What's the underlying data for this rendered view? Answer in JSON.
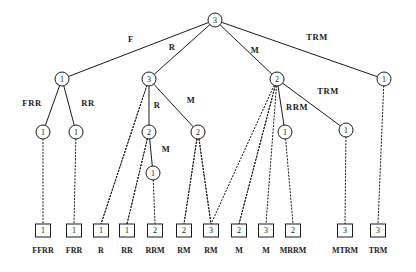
{
  "figure": {
    "type": "tree-diagram",
    "background_color": "#ffffff",
    "stroke_color": "#1a1a1a",
    "width": 416,
    "height": 272
  },
  "nodes": [
    {
      "id": "root",
      "label": "3",
      "x": 215,
      "y": 20,
      "r": 7,
      "depth": 0
    },
    {
      "id": "n-l1",
      "label": "1",
      "x": 62,
      "y": 79,
      "r": 7,
      "depth": 1
    },
    {
      "id": "n-l2",
      "label": "3",
      "x": 149,
      "y": 79,
      "r": 7,
      "depth": 1
    },
    {
      "id": "n-l3",
      "label": "2",
      "x": 277,
      "y": 79,
      "r": 7,
      "depth": 1
    },
    {
      "id": "n-l4",
      "label": "1",
      "x": 384,
      "y": 79,
      "r": 7,
      "depth": 1
    },
    {
      "id": "n-m1",
      "label": "1",
      "x": 43,
      "y": 132,
      "r": 7,
      "depth": 2
    },
    {
      "id": "n-m2",
      "label": "1",
      "x": 76,
      "y": 132,
      "r": 7,
      "depth": 2
    },
    {
      "id": "n-m3",
      "label": "2",
      "x": 149,
      "y": 132,
      "r": 7,
      "depth": 2
    },
    {
      "id": "n-m4",
      "label": "2",
      "x": 198,
      "y": 132,
      "r": 7,
      "depth": 2
    },
    {
      "id": "n-m5",
      "label": "1",
      "x": 285,
      "y": 132,
      "r": 7,
      "depth": 2
    },
    {
      "id": "n-m6",
      "label": "1",
      "x": 346,
      "y": 130,
      "r": 7,
      "depth": 2
    },
    {
      "id": "n-d1",
      "label": "1",
      "x": 153,
      "y": 173,
      "r": 7,
      "depth": 3
    }
  ],
  "edges": [
    {
      "from": "root",
      "to": "n-l1",
      "style": "solid",
      "label": "F",
      "lx": 131,
      "ly": 42
    },
    {
      "from": "root",
      "to": "n-l2",
      "style": "solid",
      "label": "R",
      "lx": 172,
      "ly": 50
    },
    {
      "from": "root",
      "to": "n-l3",
      "style": "solid",
      "label": "M",
      "lx": 255,
      "ly": 53
    },
    {
      "from": "root",
      "to": "n-l4",
      "style": "solid",
      "label": "TRM",
      "lx": 317,
      "ly": 40
    },
    {
      "from": "n-l1",
      "to": "n-m1",
      "style": "solid",
      "label": "FRR",
      "lx": 32,
      "ly": 106
    },
    {
      "from": "n-l1",
      "to": "n-m2",
      "style": "solid",
      "label": "RR",
      "lx": 88,
      "ly": 106
    },
    {
      "from": "n-l2",
      "to": "n-m3",
      "style": "solid",
      "label": "R",
      "lx": 157,
      "ly": 108
    },
    {
      "from": "n-l2",
      "to": "n-m4",
      "style": "solid",
      "label": "M",
      "lx": 191,
      "ly": 103
    },
    {
      "from": "n-l3",
      "to": "n-m5",
      "style": "solid",
      "label": "RRM",
      "lx": 297,
      "ly": 110
    },
    {
      "from": "n-l3",
      "to": "n-m6",
      "style": "solid",
      "label": "TRM",
      "lx": 328,
      "ly": 94
    },
    {
      "from": "n-m3",
      "to": "n-d1",
      "style": "solid",
      "label": "M",
      "lx": 166,
      "ly": 152
    }
  ],
  "dotted_edges": [
    {
      "from": "n-l2",
      "to_leaf": 2
    },
    {
      "from": "n-l3",
      "to_leaf": 6
    },
    {
      "from": "n-l3",
      "to_leaf": 7
    },
    {
      "from": "n-m3",
      "to_leaf": 3
    },
    {
      "from": "n-m4",
      "to_leaf": 5
    },
    {
      "from": "n-m4",
      "to_leaf": 6
    }
  ],
  "leaves": [
    {
      "index": 0,
      "value": "1",
      "caption": "FFRR",
      "x": 43,
      "parent": "n-m1"
    },
    {
      "index": 1,
      "value": "1",
      "caption": "FRR",
      "x": 74,
      "parent": "n-m2"
    },
    {
      "index": 2,
      "value": "1",
      "caption": "R",
      "x": 101,
      "parent": "n-l2"
    },
    {
      "index": 3,
      "value": "1",
      "caption": "RR",
      "x": 127,
      "parent": "n-m3"
    },
    {
      "index": 4,
      "value": "2",
      "caption": "RRM",
      "x": 155,
      "parent": "n-d1"
    },
    {
      "index": 5,
      "value": "2",
      "caption": "RM",
      "x": 184,
      "parent": "n-m4"
    },
    {
      "index": 6,
      "value": "3",
      "caption": "RM",
      "x": 211,
      "parent": "n-m4"
    },
    {
      "index": 7,
      "value": "2",
      "caption": "M",
      "x": 239,
      "parent": "n-l3"
    },
    {
      "index": 8,
      "value": "3",
      "caption": "M",
      "x": 266,
      "parent": "n-l3"
    },
    {
      "index": 9,
      "value": "2",
      "caption": "MRRM",
      "x": 293,
      "parent": "n-m5"
    },
    {
      "index": 10,
      "value": "3",
      "caption": "MTRM",
      "x": 345,
      "parent": "n-m6"
    },
    {
      "index": 11,
      "value": "3",
      "caption": "TRM",
      "x": 378,
      "parent": "n-l4"
    }
  ],
  "leaf_layout": {
    "box_y": 224,
    "box_w": 15,
    "box_h": 13,
    "caption_y": 250
  }
}
